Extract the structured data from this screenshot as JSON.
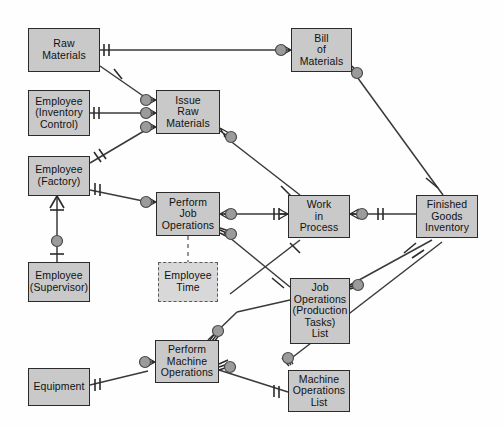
{
  "diagram": {
    "colors": {
      "entity_fill": "#c9c9c9",
      "weak_entity_fill": "#d8d8d8",
      "border": "#2b2b2b",
      "line": "#3a3a3a",
      "connector_dot": "#9b9b9b",
      "background": "#fefefe"
    },
    "entities": [
      {
        "id": "raw-materials",
        "label": "Raw\nMaterials",
        "x": 28,
        "y": 28,
        "w": 72,
        "h": 44,
        "weak": false
      },
      {
        "id": "employee-inventory-control",
        "label": "Employee\n(Inventory\nControl)",
        "x": 28,
        "y": 90,
        "w": 62,
        "h": 46,
        "weak": false
      },
      {
        "id": "employee-factory",
        "label": "Employee\n(Factory)",
        "x": 28,
        "y": 156,
        "w": 62,
        "h": 40,
        "weak": false
      },
      {
        "id": "employee-supervisor",
        "label": "Employee\n(Supervisor)",
        "x": 28,
        "y": 262,
        "w": 62,
        "h": 40,
        "weak": false
      },
      {
        "id": "equipment",
        "label": "Equipment",
        "x": 28,
        "y": 368,
        "w": 62,
        "h": 38,
        "weak": false
      },
      {
        "id": "issue-raw-materials",
        "label": "Issue\nRaw\nMaterials",
        "x": 156,
        "y": 90,
        "w": 64,
        "h": 44,
        "weak": false
      },
      {
        "id": "perform-job-operations",
        "label": "Perform\nJob\nOperations",
        "x": 156,
        "y": 192,
        "w": 64,
        "h": 44,
        "weak": false
      },
      {
        "id": "employee-time",
        "label": "Employee\nTime",
        "x": 158,
        "y": 262,
        "w": 60,
        "h": 40,
        "weak": true
      },
      {
        "id": "perform-machine-operations",
        "label": "Perform\nMachine\nOperations",
        "x": 155,
        "y": 340,
        "w": 64,
        "h": 43,
        "weak": false
      },
      {
        "id": "bill-of-materials",
        "label": "Bill\nof\nMaterials",
        "x": 291,
        "y": 28,
        "w": 61,
        "h": 44,
        "weak": false
      },
      {
        "id": "work-in-process",
        "label": "Work\nin\nProcess",
        "x": 288,
        "y": 195,
        "w": 62,
        "h": 43,
        "weak": false
      },
      {
        "id": "job-operations-list",
        "label": "Job\nOperations\n(Production\nTasks)\nList",
        "x": 290,
        "y": 278,
        "w": 60,
        "h": 66,
        "weak": false
      },
      {
        "id": "machine-operations-list",
        "label": "Machine\nOperations\nList",
        "x": 288,
        "y": 370,
        "w": 62,
        "h": 42,
        "weak": false
      },
      {
        "id": "finished-goods-inventory",
        "label": "Finished\nGoods\nInventory",
        "x": 416,
        "y": 195,
        "w": 62,
        "h": 43,
        "weak": false
      }
    ],
    "relationships": [
      {
        "id": "rawmaterials-billofmaterials",
        "from": "raw-materials",
        "to": "bill-of-materials",
        "from_card": "one-mandatory",
        "to_card": "many"
      },
      {
        "id": "rawmaterials-issuerawmaterials",
        "from": "raw-materials",
        "to": "issue-raw-materials",
        "from_card": "one-optional",
        "to_card": "many"
      },
      {
        "id": "empinvctrl-issuerawmaterials",
        "from": "employee-inventory-control",
        "to": "issue-raw-materials",
        "from_card": "one-mandatory",
        "to_card": "many"
      },
      {
        "id": "empfactory-issuerawmaterials",
        "from": "employee-factory",
        "to": "issue-raw-materials",
        "from_card": "one-optional",
        "to_card": "many"
      },
      {
        "id": "empfactory-performjobops",
        "from": "employee-factory",
        "to": "perform-job-operations",
        "from_card": "one-mandatory",
        "to_card": "many"
      },
      {
        "id": "empfactory-empsupervisor",
        "from": "employee-factory",
        "to": "employee-supervisor",
        "from_card": "many",
        "to_card": "one-mandatory"
      },
      {
        "id": "issuerawmaterials-workinprocess",
        "from": "issue-raw-materials",
        "to": "work-in-process",
        "from_card": "many",
        "to_card": "one-optional"
      },
      {
        "id": "billofmaterials-finishedgoods",
        "from": "bill-of-materials",
        "to": "finished-goods-inventory",
        "from_card": "many",
        "to_card": "one-optional"
      },
      {
        "id": "performjobops-workinprocess",
        "from": "perform-job-operations",
        "to": "work-in-process",
        "from_card": "many",
        "to_card": "one-mandatory"
      },
      {
        "id": "performjobops-joboperationslist",
        "from": "perform-job-operations",
        "to": "job-operations-list",
        "from_card": "many",
        "to_card": "one-optional"
      },
      {
        "id": "performjobops-employeetime",
        "from": "perform-job-operations",
        "to": "employee-time",
        "from_card": "weak",
        "to_card": "weak"
      },
      {
        "id": "workinprocess-finishedgoods",
        "from": "work-in-process",
        "to": "finished-goods-inventory",
        "from_card": "many",
        "to_card": "one-mandatory"
      },
      {
        "id": "workinprocess-joboperationslist",
        "from": "work-in-process",
        "to": "job-operations-list",
        "from_card": "one-optional",
        "to_card": "one-optional"
      },
      {
        "id": "joboperationslist-finishedgoods",
        "from": "job-operations-list",
        "to": "finished-goods-inventory",
        "from_card": "many",
        "to_card": "one-optional"
      },
      {
        "id": "machineoperationslist-finishedgoods",
        "from": "machine-operations-list",
        "to": "finished-goods-inventory",
        "from_card": "many",
        "to_card": "one-optional"
      },
      {
        "id": "performmachineops-joboperationslist",
        "from": "perform-machine-operations",
        "to": "job-operations-list",
        "from_card": "many",
        "to_card": "one-optional"
      },
      {
        "id": "equipment-performmachineops",
        "from": "equipment",
        "to": "perform-machine-operations",
        "from_card": "one-mandatory",
        "to_card": "many"
      },
      {
        "id": "performmachineops-machineopslist",
        "from": "perform-machine-operations",
        "to": "machine-operations-list",
        "from_card": "many",
        "to_card": "one-mandatory"
      }
    ]
  }
}
